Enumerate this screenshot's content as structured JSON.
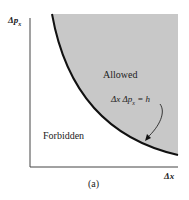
{
  "figure": {
    "y_axis_label": "Δp",
    "y_axis_subscript": "x",
    "x_axis_label": "Δx",
    "region_allowed": "Allowed",
    "region_forbidden": "Forbidden",
    "equation": "Δx Δp",
    "equation_subscript": "x",
    "equation_rhs": " = h",
    "caption": "(a)",
    "colors": {
      "allowed_fill": "#c8c8c8",
      "curve": "#111111",
      "axis": "#333333",
      "background": "#ffffff"
    }
  }
}
